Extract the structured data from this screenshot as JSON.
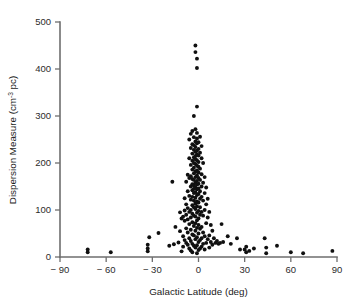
{
  "chart_data": {
    "type": "scatter",
    "title": "",
    "xlabel": "Galactic Latitude (deg)",
    "ylabel_prefix": "Dispersion Measure (cm",
    "ylabel_sup": "-3",
    "ylabel_suffix": " pc)",
    "ylabel": "Dispersion Measure (cm^-3 pc)",
    "xlim": [
      -90,
      90
    ],
    "ylim": [
      0,
      500
    ],
    "xticks": [
      -90,
      -60,
      -30,
      0,
      30,
      60,
      90
    ],
    "xtick_labels": [
      "− 90",
      "− 60",
      "− 30",
      "0",
      "30",
      "60",
      "90"
    ],
    "yticks": [
      0,
      100,
      200,
      300,
      400,
      500
    ],
    "ytick_labels": [
      "0",
      "100",
      "200",
      "300",
      "400",
      "500"
    ],
    "grid": false,
    "legend": false,
    "marker": "filled-circle",
    "marker_color": "#101010",
    "marker_size_px": 3.0,
    "n_points": 186,
    "points": [
      [
        -72,
        16
      ],
      [
        -72,
        10
      ],
      [
        -57,
        10
      ],
      [
        -33,
        18
      ],
      [
        -33,
        12
      ],
      [
        -33,
        26
      ],
      [
        -32,
        42
      ],
      [
        -26,
        51
      ],
      [
        -19,
        24
      ],
      [
        -17,
        160
      ],
      [
        -16,
        27
      ],
      [
        -15,
        64
      ],
      [
        -13,
        31
      ],
      [
        -12,
        95
      ],
      [
        -12,
        55
      ],
      [
        -11,
        82
      ],
      [
        -11,
        12
      ],
      [
        -10,
        86
      ],
      [
        -10,
        44
      ],
      [
        -10,
        22
      ],
      [
        -9,
        125
      ],
      [
        -9,
        99
      ],
      [
        -9,
        77
      ],
      [
        -9,
        36
      ],
      [
        -8,
        160
      ],
      [
        -8,
        112
      ],
      [
        -8,
        90
      ],
      [
        -8,
        61
      ],
      [
        -8,
        30
      ],
      [
        -7,
        175
      ],
      [
        -7,
        140
      ],
      [
        -7,
        104
      ],
      [
        -7,
        80
      ],
      [
        -7,
        52
      ],
      [
        -7,
        26
      ],
      [
        -6,
        250
      ],
      [
        -6,
        210
      ],
      [
        -6,
        168
      ],
      [
        -6,
        130
      ],
      [
        -6,
        96
      ],
      [
        -6,
        70
      ],
      [
        -6,
        40
      ],
      [
        -6,
        18
      ],
      [
        -5,
        262
      ],
      [
        -5,
        232
      ],
      [
        -5,
        196
      ],
      [
        -5,
        172
      ],
      [
        -5,
        150
      ],
      [
        -5,
        122
      ],
      [
        -5,
        100
      ],
      [
        -5,
        84
      ],
      [
        -5,
        58
      ],
      [
        -5,
        34
      ],
      [
        -5,
        14
      ],
      [
        -4,
        268
      ],
      [
        -4,
        240
      ],
      [
        -4,
        220
      ],
      [
        -4,
        205
      ],
      [
        -4,
        186
      ],
      [
        -4,
        166
      ],
      [
        -4,
        155
      ],
      [
        -4,
        142
      ],
      [
        -4,
        128
      ],
      [
        -4,
        110
      ],
      [
        -4,
        92
      ],
      [
        -4,
        74
      ],
      [
        -4,
        48
      ],
      [
        -4,
        28
      ],
      [
        -4,
        10
      ],
      [
        -3,
        300
      ],
      [
        -3,
        255
      ],
      [
        -3,
        238
      ],
      [
        -3,
        228
      ],
      [
        -3,
        212
      ],
      [
        -3,
        200
      ],
      [
        -3,
        190
      ],
      [
        -3,
        178
      ],
      [
        -3,
        164
      ],
      [
        -3,
        152
      ],
      [
        -3,
        145
      ],
      [
        -3,
        136
      ],
      [
        -3,
        120
      ],
      [
        -3,
        106
      ],
      [
        -3,
        88
      ],
      [
        -3,
        66
      ],
      [
        -3,
        46
      ],
      [
        -3,
        24
      ],
      [
        -2,
        450
      ],
      [
        -2,
        436
      ],
      [
        -2,
        272
      ],
      [
        -2,
        246
      ],
      [
        -2,
        234
      ],
      [
        -2,
        224
      ],
      [
        -2,
        215
      ],
      [
        -2,
        208
      ],
      [
        -2,
        198
      ],
      [
        -2,
        182
      ],
      [
        -2,
        170
      ],
      [
        -2,
        158
      ],
      [
        -2,
        148
      ],
      [
        -2,
        138
      ],
      [
        -2,
        126
      ],
      [
        -2,
        114
      ],
      [
        -2,
        102
      ],
      [
        -2,
        86
      ],
      [
        -2,
        72
      ],
      [
        -2,
        56
      ],
      [
        -2,
        38
      ],
      [
        -2,
        20
      ],
      [
        -1,
        422
      ],
      [
        -1,
        402
      ],
      [
        -1,
        320
      ],
      [
        -1,
        264
      ],
      [
        -1,
        252
      ],
      [
        -1,
        242
      ],
      [
        -1,
        226
      ],
      [
        -1,
        218
      ],
      [
        -1,
        206
      ],
      [
        -1,
        194
      ],
      [
        -1,
        184
      ],
      [
        -1,
        174
      ],
      [
        -1,
        162
      ],
      [
        -1,
        154
      ],
      [
        -1,
        144
      ],
      [
        -1,
        132
      ],
      [
        -1,
        118
      ],
      [
        -1,
        108
      ],
      [
        -1,
        94
      ],
      [
        -1,
        78
      ],
      [
        -1,
        62
      ],
      [
        -1,
        42
      ],
      [
        -1,
        25
      ],
      [
        -1,
        8
      ],
      [
        0,
        244
      ],
      [
        0,
        230
      ],
      [
        0,
        216
      ],
      [
        0,
        202
      ],
      [
        0,
        192
      ],
      [
        0,
        180
      ],
      [
        0,
        168
      ],
      [
        0,
        156
      ],
      [
        0,
        146
      ],
      [
        0,
        134
      ],
      [
        0,
        116
      ],
      [
        0,
        98
      ],
      [
        0,
        82
      ],
      [
        0,
        68
      ],
      [
        0,
        50
      ],
      [
        0,
        32
      ],
      [
        0,
        15
      ],
      [
        1,
        256
      ],
      [
        1,
        222
      ],
      [
        1,
        188
      ],
      [
        1,
        164
      ],
      [
        1,
        140
      ],
      [
        1,
        124
      ],
      [
        1,
        106
      ],
      [
        1,
        90
      ],
      [
        1,
        60
      ],
      [
        1,
        36
      ],
      [
        1,
        18
      ],
      [
        2,
        236
      ],
      [
        2,
        210
      ],
      [
        2,
        176
      ],
      [
        2,
        150
      ],
      [
        2,
        128
      ],
      [
        2,
        96
      ],
      [
        2,
        64
      ],
      [
        2,
        40
      ],
      [
        2,
        22
      ],
      [
        3,
        200
      ],
      [
        3,
        158
      ],
      [
        3,
        120
      ],
      [
        3,
        88
      ],
      [
        3,
        52
      ],
      [
        3,
        28
      ],
      [
        4,
        170
      ],
      [
        4,
        136
      ],
      [
        4,
        100
      ],
      [
        4,
        44
      ],
      [
        4,
        16
      ],
      [
        5,
        148
      ],
      [
        5,
        112
      ],
      [
        5,
        72
      ],
      [
        5,
        30
      ],
      [
        6,
        124
      ],
      [
        6,
        84
      ],
      [
        6,
        38
      ],
      [
        7,
        96
      ],
      [
        7,
        46
      ],
      [
        7,
        20
      ],
      [
        8,
        68
      ],
      [
        8,
        32
      ],
      [
        9,
        56
      ],
      [
        9,
        26
      ],
      [
        10,
        40
      ],
      [
        11,
        30
      ],
      [
        12,
        34
      ],
      [
        13,
        28
      ],
      [
        14,
        30
      ],
      [
        15,
        70
      ],
      [
        16,
        32
      ],
      [
        19,
        44
      ],
      [
        21,
        28
      ],
      [
        25,
        40
      ],
      [
        27,
        16
      ],
      [
        30,
        16
      ],
      [
        31,
        22
      ],
      [
        31,
        10
      ],
      [
        33,
        13
      ],
      [
        36,
        18
      ],
      [
        43,
        40
      ],
      [
        44,
        20
      ],
      [
        44,
        8
      ],
      [
        51,
        24
      ],
      [
        60,
        10
      ],
      [
        68,
        8
      ],
      [
        87,
        13
      ]
    ]
  }
}
